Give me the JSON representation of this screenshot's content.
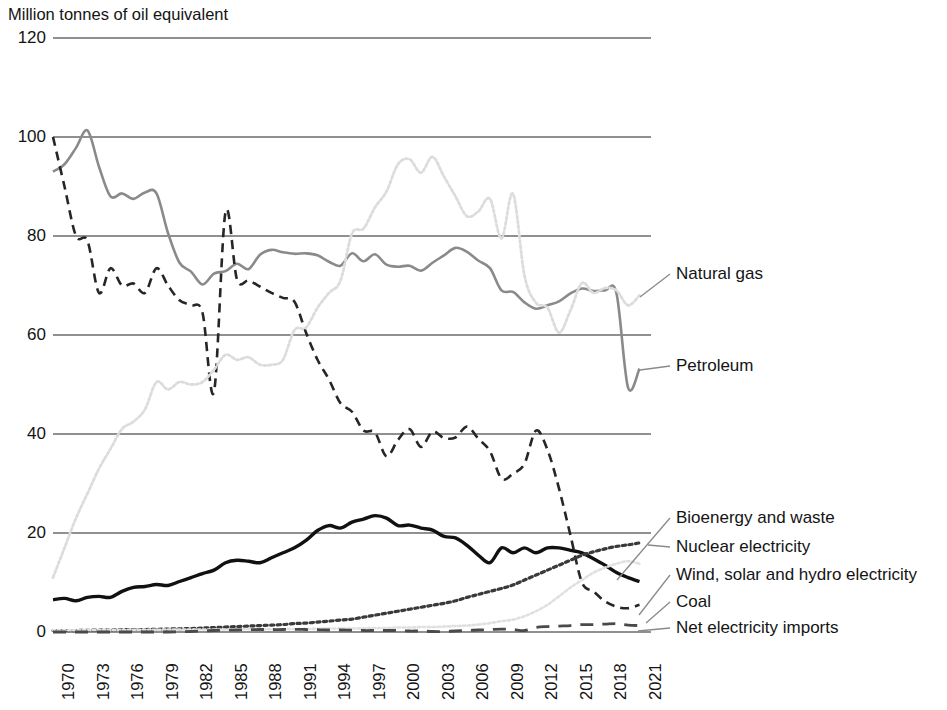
{
  "chart_data": {
    "type": "line",
    "title": "Million tonnes of oil equivalent",
    "xlabel": "",
    "ylabel": "Million tonnes of oil equivalent",
    "ylim": [
      0,
      120
    ],
    "yticks": [
      0,
      20,
      40,
      60,
      80,
      100,
      120
    ],
    "ytick_labels": [
      "0",
      "20",
      "40",
      "60",
      "80",
      "100",
      "120"
    ],
    "xlim": [
      1970,
      2022
    ],
    "xticks": [
      1970,
      1973,
      1976,
      1979,
      1982,
      1985,
      1988,
      1991,
      1994,
      1997,
      2000,
      2003,
      2006,
      2009,
      2012,
      2015,
      2018,
      2021
    ],
    "xtick_labels": [
      "1970",
      "1973",
      "1976",
      "1979",
      "1982",
      "1985",
      "1988",
      "1991",
      "1994",
      "1997",
      "2000",
      "2003",
      "2006",
      "2009",
      "2012",
      "2015",
      "2018",
      "2021"
    ],
    "grid": "horizontal",
    "legend_position": "right-inline",
    "x": [
      1970,
      1971,
      1972,
      1973,
      1974,
      1975,
      1976,
      1977,
      1978,
      1979,
      1980,
      1981,
      1982,
      1983,
      1984,
      1985,
      1986,
      1987,
      1988,
      1989,
      1990,
      1991,
      1992,
      1993,
      1994,
      1995,
      1996,
      1997,
      1998,
      1999,
      2000,
      2001,
      2002,
      2003,
      2004,
      2005,
      2006,
      2007,
      2008,
      2009,
      2010,
      2011,
      2012,
      2013,
      2014,
      2015,
      2016,
      2017,
      2018,
      2019,
      2020,
      2021
    ],
    "series": [
      {
        "name": "Petroleum",
        "color": "#8a8a8a",
        "style": "solid",
        "width": 2.6,
        "values": [
          93.0,
          94.5,
          97.8,
          101.3,
          94.0,
          88.0,
          88.6,
          87.5,
          88.8,
          88.6,
          80.6,
          74.6,
          72.8,
          70.2,
          72.4,
          72.9,
          74.4,
          73.3,
          76.2,
          77.2,
          76.7,
          76.4,
          76.5,
          76.1,
          74.8,
          74.0,
          76.5,
          74.9,
          76.3,
          74.2,
          73.8,
          74.0,
          73.0,
          74.6,
          76.1,
          77.6,
          76.8,
          75.0,
          73.5,
          69.0,
          68.7,
          66.6,
          65.3,
          66.0,
          66.8,
          68.4,
          69.4,
          68.9,
          69.0,
          68.4,
          49.4,
          53.2
        ]
      },
      {
        "name": "Coal",
        "color": "#262626",
        "style": "dashed",
        "width": 2.6,
        "values": [
          100.0,
          90.0,
          80.0,
          79.0,
          68.5,
          73.5,
          70.0,
          70.4,
          68.5,
          73.5,
          70.0,
          67.0,
          66.0,
          64.5,
          48.5,
          84.8,
          71.2,
          71.0,
          69.8,
          68.5,
          67.5,
          66.7,
          60.5,
          55.0,
          51.0,
          46.2,
          44.5,
          40.7,
          40.3,
          35.5,
          38.8,
          41.0,
          37.4,
          40.5,
          39.2,
          39.3,
          41.5,
          39.0,
          36.5,
          31.0,
          32.0,
          34.0,
          40.7,
          36.8,
          29.0,
          19.5,
          10.0,
          8.2,
          6.2,
          5.1,
          4.8,
          5.5
        ]
      },
      {
        "name": "Natural gas",
        "color": "#dcdcdc",
        "style": "dotted",
        "width": 2.8,
        "values": [
          11.0,
          17.0,
          23.0,
          28.0,
          33.0,
          37.0,
          41.0,
          42.5,
          45.0,
          50.5,
          49.0,
          50.5,
          50.0,
          50.5,
          53.0,
          56.0,
          55.0,
          55.5,
          54.0,
          54.0,
          55.0,
          61.0,
          61.5,
          65.5,
          68.5,
          71.0,
          80.5,
          81.5,
          85.8,
          89.0,
          94.5,
          95.5,
          92.8,
          96.0,
          92.0,
          88.0,
          84.0,
          85.0,
          87.5,
          79.5,
          88.5,
          72.0,
          66.5,
          65.5,
          60.5,
          65.0,
          70.5,
          68.5,
          69.5,
          69.0,
          66.0,
          68.0
        ]
      },
      {
        "name": "Bioenergy and waste",
        "color": "#111111",
        "style": "solid",
        "width": 3.4,
        "values": [
          6.5,
          6.8,
          6.3,
          7.0,
          7.2,
          7.0,
          8.2,
          9.0,
          9.2,
          9.6,
          9.4,
          10.2,
          11.0,
          11.8,
          12.5,
          14.0,
          14.5,
          14.3,
          14.0,
          15.0,
          16.0,
          17.0,
          18.5,
          20.5,
          21.5,
          21.0,
          22.2,
          22.8,
          23.5,
          23.0,
          21.5,
          21.6,
          21.0,
          20.6,
          19.3,
          19.0,
          17.5,
          15.5,
          14.0,
          17.0,
          16.0,
          17.0,
          16.0,
          17.0,
          17.0,
          16.5,
          16.0,
          14.8,
          13.5,
          12.0,
          11.0,
          10.2
        ]
      },
      {
        "name": "Nuclear electricity",
        "color": "#3a3a3a",
        "style": "dotted-heavy",
        "width": 3.2,
        "values": [
          0.3,
          0.3,
          0.3,
          0.35,
          0.4,
          0.4,
          0.45,
          0.5,
          0.5,
          0.55,
          0.6,
          0.65,
          0.7,
          0.8,
          0.9,
          1.0,
          1.1,
          1.2,
          1.3,
          1.4,
          1.5,
          1.7,
          1.8,
          2.0,
          2.2,
          2.4,
          2.6,
          3.0,
          3.4,
          3.8,
          4.2,
          4.6,
          5.0,
          5.4,
          5.8,
          6.3,
          7.0,
          7.6,
          8.2,
          8.8,
          9.5,
          10.5,
          11.5,
          12.5,
          13.5,
          14.5,
          15.5,
          16.2,
          16.8,
          17.3,
          17.6,
          18.0
        ]
      },
      {
        "name": "Wind, solar and hydro electricity",
        "color": "#e0e0e0",
        "style": "dotted",
        "width": 2.6,
        "values": [
          0.35,
          0.35,
          0.35,
          0.4,
          0.4,
          0.4,
          0.4,
          0.45,
          0.45,
          0.45,
          0.5,
          0.5,
          0.5,
          0.5,
          0.5,
          0.5,
          0.55,
          0.55,
          0.55,
          0.55,
          0.6,
          0.6,
          0.6,
          0.65,
          0.7,
          0.7,
          0.7,
          0.75,
          0.8,
          0.8,
          0.9,
          0.9,
          1.0,
          1.0,
          1.1,
          1.2,
          1.3,
          1.5,
          1.8,
          2.2,
          2.5,
          3.2,
          4.2,
          5.5,
          7.2,
          9.0,
          10.5,
          12.0,
          13.0,
          13.8,
          14.3,
          13.8
        ]
      },
      {
        "name": "Net electricity imports",
        "color": "#4a4a4a",
        "style": "dashed-wide",
        "width": 2.8,
        "values": [
          0.0,
          0.0,
          0.0,
          0.0,
          0.0,
          0.0,
          0.0,
          0.0,
          0.0,
          0.0,
          0.0,
          0.05,
          0.1,
          0.2,
          0.3,
          0.35,
          0.4,
          0.45,
          0.5,
          0.5,
          0.5,
          0.55,
          0.5,
          0.45,
          0.4,
          0.4,
          0.35,
          0.3,
          0.3,
          0.3,
          0.3,
          0.2,
          0.2,
          0.1,
          0.1,
          0.2,
          0.3,
          0.4,
          0.5,
          0.6,
          0.5,
          0.3,
          0.9,
          1.1,
          1.2,
          1.3,
          1.5,
          1.5,
          1.6,
          1.7,
          1.4,
          1.3
        ]
      }
    ],
    "annotations": [
      {
        "label": "Natural gas",
        "series": "Natural gas"
      },
      {
        "label": "Petroleum",
        "series": "Petroleum"
      },
      {
        "label": "Bioenergy and waste",
        "series": "Bioenergy and waste"
      },
      {
        "label": "Nuclear electricity",
        "series": "Nuclear electricity"
      },
      {
        "label": "Wind, solar and hydro electricity",
        "series": "Wind, solar and hydro electricity"
      },
      {
        "label": "Coal",
        "series": "Coal"
      },
      {
        "label": "Net electricity imports",
        "series": "Net electricity imports"
      }
    ]
  },
  "legend_labels": {
    "natural_gas": "Natural gas",
    "petroleum": "Petroleum",
    "bioenergy": "Bioenergy and waste",
    "nuclear": "Nuclear electricity",
    "wind_solar_hydro": "Wind, solar and hydro electricity",
    "coal": "Coal",
    "net_imports": "Net electricity imports"
  }
}
